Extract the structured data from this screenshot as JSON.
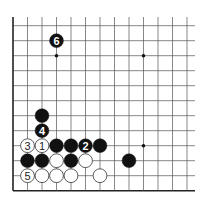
{
  "diagram": {
    "type": "go-board-fragment",
    "grid": {
      "columns": 13,
      "rows": 12,
      "origin_x": 13,
      "origin_y": 25.7,
      "col_spacing": 14.5,
      "row_spacing": 15,
      "left_edge": true,
      "bottom_edge": true,
      "top_open_to_y": 17,
      "right_open_to_x": 195,
      "line_color": "#555555",
      "edge_color": "#222222"
    },
    "star_points": [
      {
        "c": 3,
        "r": 2
      },
      {
        "c": 9,
        "r": 2
      },
      {
        "c": 9,
        "r": 8
      }
    ],
    "stones": [
      {
        "c": 3,
        "r": 1,
        "color": "black",
        "label": "6"
      },
      {
        "c": 2,
        "r": 6,
        "color": "black",
        "label": ""
      },
      {
        "c": 2,
        "r": 7,
        "color": "black",
        "label": "4"
      },
      {
        "c": 1,
        "r": 8,
        "color": "white",
        "label": "3"
      },
      {
        "c": 2,
        "r": 8,
        "color": "white",
        "label": "1"
      },
      {
        "c": 3,
        "r": 8,
        "color": "black",
        "label": ""
      },
      {
        "c": 4,
        "r": 8,
        "color": "black",
        "label": ""
      },
      {
        "c": 5,
        "r": 8,
        "color": "black",
        "label": "2"
      },
      {
        "c": 6,
        "r": 8,
        "color": "black",
        "label": ""
      },
      {
        "c": 1,
        "r": 9,
        "color": "black",
        "label": ""
      },
      {
        "c": 2,
        "r": 9,
        "color": "black",
        "label": ""
      },
      {
        "c": 3,
        "r": 9,
        "color": "white",
        "label": ""
      },
      {
        "c": 4,
        "r": 9,
        "color": "black",
        "label": ""
      },
      {
        "c": 5,
        "r": 9,
        "color": "white",
        "label": ""
      },
      {
        "c": 8,
        "r": 9,
        "color": "black",
        "label": ""
      },
      {
        "c": 1,
        "r": 10,
        "color": "white",
        "label": "5"
      },
      {
        "c": 2,
        "r": 10,
        "color": "white",
        "label": ""
      },
      {
        "c": 3,
        "r": 10,
        "color": "white",
        "label": ""
      },
      {
        "c": 4,
        "r": 10,
        "color": "white",
        "label": ""
      },
      {
        "c": 6,
        "r": 10,
        "color": "white",
        "label": ""
      }
    ],
    "colors": {
      "black_stone": "#111111",
      "white_stone": "#ffffff",
      "white_stone_outline": "#333333",
      "black_label": "#ffffff",
      "white_label": "#222222"
    }
  }
}
